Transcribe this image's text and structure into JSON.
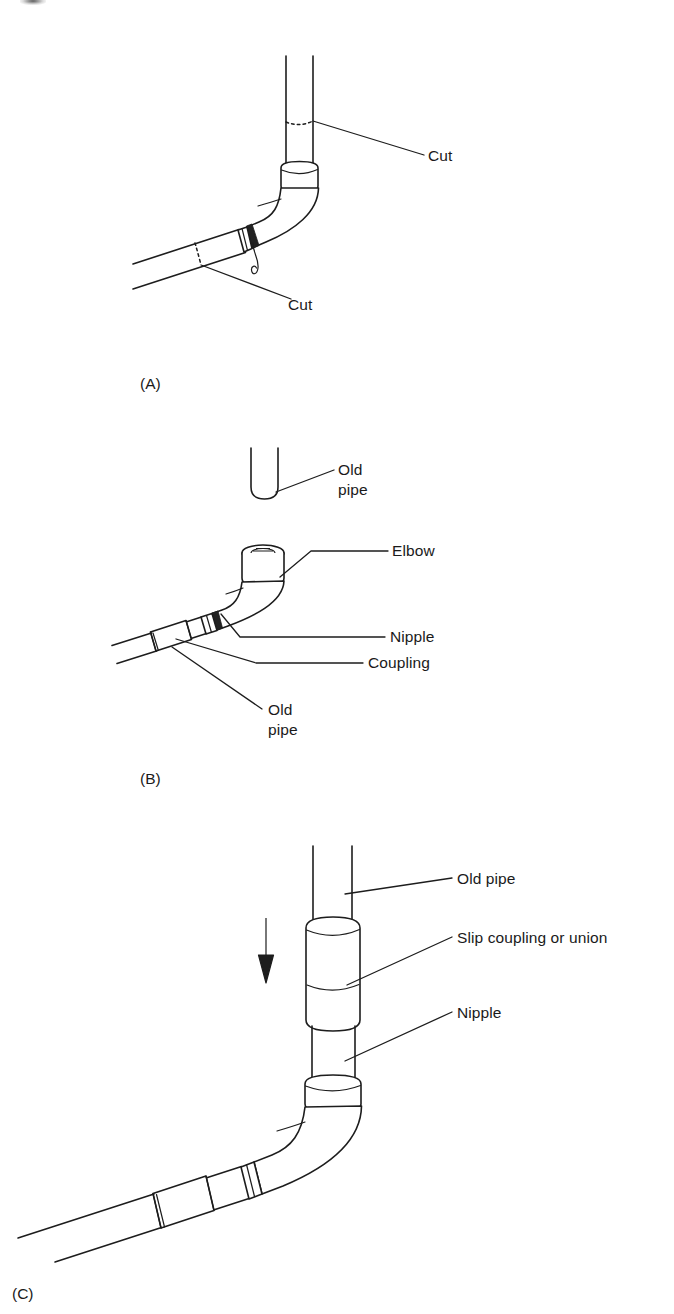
{
  "figure": {
    "caption_type": "multi-panel technical line drawing",
    "background_color": "#ffffff",
    "ink_color": "#1d1d1d"
  },
  "panels": [
    {
      "id": "A",
      "letter": "(A)",
      "subject": "Existing elbow joint with two cut marks indicated",
      "labels": [
        {
          "name": "cut-upper",
          "text": "Cut"
        },
        {
          "name": "cut-lower",
          "text": "Cut"
        }
      ]
    },
    {
      "id": "B",
      "letter": "(B)",
      "subject": "Replacement fitting assembly: elbow with nipple and coupling",
      "labels": [
        {
          "name": "old-pipe-top",
          "text": "Old\npipe",
          "line1": "Old",
          "line2": "pipe"
        },
        {
          "name": "elbow",
          "text": "Elbow"
        },
        {
          "name": "nipple",
          "text": "Nipple"
        },
        {
          "name": "coupling",
          "text": "Coupling"
        },
        {
          "name": "old-pipe-bottom",
          "text": "Old\npipe",
          "line1": "Old",
          "line2": "pipe"
        }
      ]
    },
    {
      "id": "C",
      "letter": "(C)",
      "subject": "Completed repair: old pipe lowered into slip coupling over nipple at elbow",
      "labels": [
        {
          "name": "old-pipe",
          "text": "Old pipe"
        },
        {
          "name": "slip-coupling",
          "text": "Slip coupling or union"
        },
        {
          "name": "nipple",
          "text": "Nipple"
        }
      ],
      "annotations": [
        {
          "name": "down-arrow",
          "meaning": "slide down"
        }
      ]
    }
  ]
}
